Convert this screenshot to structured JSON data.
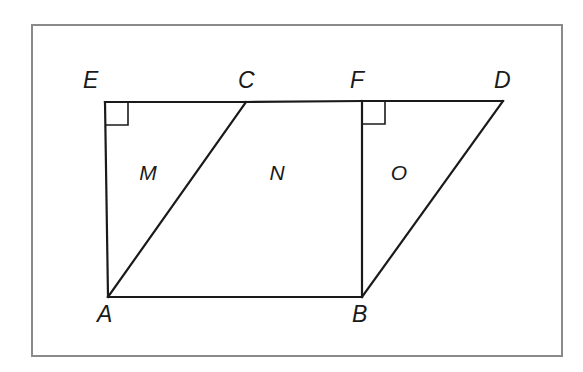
{
  "figure": {
    "background_color": "#ffffff",
    "stroke_color": "#1a1a1a",
    "frame": {
      "name": "outer-border",
      "x": 32,
      "y": 25,
      "width": 530,
      "height": 331,
      "stroke_color": "#8a8a8a",
      "stroke_width": 2
    },
    "points": {
      "A": {
        "label": "A",
        "x": 108,
        "y": 297,
        "label_x": 97,
        "label_y": 322
      },
      "B": {
        "label": "B",
        "x": 362,
        "y": 297,
        "label_x": 352,
        "label_y": 322
      },
      "C": {
        "label": "C",
        "x": 246,
        "y": 102,
        "label_x": 238,
        "label_y": 88
      },
      "D": {
        "label": "D",
        "x": 503,
        "y": 101,
        "label_x": 494,
        "label_y": 88
      },
      "E": {
        "label": "E",
        "x": 105,
        "y": 102,
        "label_x": 83,
        "label_y": 88
      },
      "F": {
        "label": "F",
        "x": 362,
        "y": 101,
        "label_x": 350,
        "label_y": 88
      }
    },
    "segments": [
      {
        "name": "segment-EC",
        "from": "E",
        "to": "C",
        "stroke_width": 2.2
      },
      {
        "name": "segment-CF",
        "from": "C",
        "to": "F",
        "stroke_width": 2.2
      },
      {
        "name": "segment-FD",
        "from": "F",
        "to": "D",
        "stroke_width": 2.2
      },
      {
        "name": "segment-EA",
        "from": "E",
        "to": "A",
        "stroke_width": 2.2
      },
      {
        "name": "segment-AB",
        "from": "A",
        "to": "B",
        "stroke_width": 2.2
      },
      {
        "name": "segment-FB",
        "from": "F",
        "to": "B",
        "stroke_width": 2.2
      },
      {
        "name": "segment-AC",
        "from": "A",
        "to": "C",
        "stroke_width": 2.2
      },
      {
        "name": "segment-BD",
        "from": "B",
        "to": "D",
        "stroke_width": 2.2
      }
    ],
    "right_angles": [
      {
        "name": "right-angle-marker-E",
        "x": 105,
        "y": 102,
        "size": 23,
        "dir_x": 1,
        "dir_y": 1
      },
      {
        "name": "right-angle-marker-F",
        "x": 362,
        "y": 101,
        "size": 23,
        "dir_x": 1,
        "dir_y": 1
      }
    ],
    "regions": [
      {
        "name": "region-label-M",
        "label": "M",
        "x": 148,
        "y": 180
      },
      {
        "name": "region-label-N",
        "label": "N",
        "x": 277,
        "y": 180
      },
      {
        "name": "region-label-O",
        "label": "O",
        "x": 399,
        "y": 180
      }
    ]
  }
}
